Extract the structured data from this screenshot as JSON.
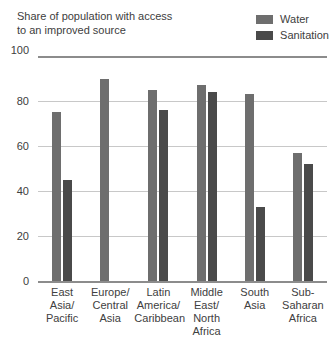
{
  "chart_data": {
    "type": "bar",
    "title": "Share of population with access\nto an improved source",
    "xlabel": "",
    "ylabel": "",
    "ylim": [
      0,
      100
    ],
    "yticks": [
      "0",
      "20",
      "40",
      "60",
      "80",
      "100"
    ],
    "grid": true,
    "legend_position": "top-right",
    "categories": [
      "East\nAsia/\nPacific",
      "Europe/\nCentral\nAsia",
      "Latin\nAmerica/\nCaribbean",
      "Middle\nEast/\nNorth\nAfrica",
      "South\nAsia",
      "Sub-\nSaharan\nAfrica"
    ],
    "series": [
      {
        "name": "Water",
        "color": "#6e6e6e",
        "values": [
          75,
          90,
          85,
          87,
          83,
          57
        ]
      },
      {
        "name": "Sanitation",
        "color": "#4a4a4a",
        "values": [
          45,
          null,
          76,
          84,
          33,
          52
        ]
      }
    ]
  },
  "colors": {
    "water": "#6e6e6e",
    "sanitation": "#4a4a4a",
    "gridline": "#c8c8c8",
    "axis": "#8c8c8c",
    "text": "#404040",
    "background": "#ffffff"
  }
}
